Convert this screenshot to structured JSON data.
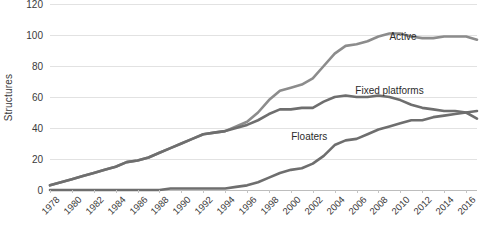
{
  "chart_data": {
    "type": "line",
    "title": "",
    "xlabel": "",
    "ylabel": "Structures",
    "xlim": [
      1978,
      2017
    ],
    "ylim": [
      0,
      120
    ],
    "ytick_step": 20,
    "yticks": [
      0,
      20,
      40,
      60,
      80,
      100,
      120
    ],
    "xticks": [
      1978,
      1980,
      1982,
      1984,
      1986,
      1988,
      1990,
      1992,
      1994,
      1996,
      1998,
      2000,
      2002,
      2004,
      2006,
      2008,
      2010,
      2012,
      2014,
      2016
    ],
    "x": [
      1978,
      1979,
      1980,
      1981,
      1982,
      1983,
      1984,
      1985,
      1986,
      1987,
      1988,
      1989,
      1990,
      1991,
      1992,
      1993,
      1994,
      1995,
      1996,
      1997,
      1998,
      1999,
      2000,
      2001,
      2002,
      2003,
      2004,
      2005,
      2006,
      2007,
      2008,
      2009,
      2010,
      2011,
      2012,
      2013,
      2014,
      2015,
      2016,
      2017
    ],
    "grid": true,
    "legend_position": "inline-annotations",
    "series": [
      {
        "name": "Active",
        "color": "#8c8c8c",
        "values": [
          3,
          5,
          7,
          9,
          11,
          13,
          15,
          18,
          19,
          21,
          24,
          27,
          30,
          33,
          36,
          37,
          38,
          41,
          44,
          50,
          58,
          64,
          66,
          68,
          72,
          80,
          88,
          93,
          94,
          96,
          99,
          101,
          101,
          99,
          98,
          98,
          99,
          99,
          99,
          97
        ]
      },
      {
        "name": "Fixed platforms",
        "color": "#6e6e6e",
        "values": [
          3,
          5,
          7,
          9,
          11,
          13,
          15,
          18,
          19,
          21,
          24,
          27,
          30,
          33,
          36,
          37,
          38,
          40,
          42,
          45,
          49,
          52,
          52,
          53,
          53,
          57,
          60,
          61,
          60,
          60,
          61,
          60,
          58,
          55,
          53,
          52,
          51,
          51,
          50,
          46
        ]
      },
      {
        "name": "Floaters",
        "color": "#6e6e6e",
        "values": [
          0,
          0,
          0,
          0,
          0,
          0,
          0,
          0,
          0,
          0,
          0,
          1,
          1,
          1,
          1,
          1,
          1,
          2,
          3,
          5,
          8,
          11,
          13,
          14,
          17,
          22,
          29,
          32,
          33,
          36,
          39,
          41,
          43,
          45,
          45,
          47,
          48,
          49,
          50,
          51
        ]
      }
    ],
    "annotations": [
      {
        "text": "Active",
        "x_pct": 79.5,
        "y_pct": 14.5
      },
      {
        "text": "Fixed platforms",
        "x_pct": 71.5,
        "y_pct": 43.5
      },
      {
        "text": "Floaters",
        "x_pct": 56.5,
        "y_pct": 68.5
      }
    ]
  }
}
